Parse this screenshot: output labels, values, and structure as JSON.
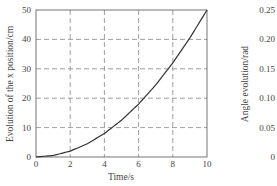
{
  "chart_data": [
    {
      "type": "line",
      "title": "",
      "xlabel": "Time/s",
      "ylabel": "Evolution of the x position/cm",
      "xlim": [
        0,
        10
      ],
      "ylim": [
        0,
        50
      ],
      "xticks": [
        "0",
        "2",
        "4",
        "6",
        "8",
        "10"
      ],
      "yticks": [
        "0",
        "10",
        "20",
        "30",
        "40",
        "50"
      ],
      "grid": "dashed",
      "legend": null,
      "series": [
        {
          "name": "x position",
          "x": [
            0,
            1,
            2,
            3,
            4,
            5,
            6,
            7,
            8,
            9,
            10
          ],
          "y": [
            0,
            0.5,
            2,
            4.5,
            8,
            12.5,
            18,
            24.5,
            32,
            40.5,
            50
          ]
        }
      ]
    },
    {
      "type": "line",
      "title": "",
      "xlabel": "",
      "ylabel": "Angle evolution/rad",
      "ylim": [
        0,
        0.25
      ],
      "yticks": [
        "0",
        "0.05",
        "0.10",
        "0.15",
        "0.20",
        "0.25"
      ],
      "partial": true,
      "series": []
    }
  ],
  "left_chart": {
    "xlabel": "Time/s",
    "ylabel": "Evolution of the x position/cm",
    "xticks": [
      "0",
      "2",
      "4",
      "6",
      "8",
      "10"
    ],
    "yticks": [
      "0",
      "10",
      "20",
      "30",
      "40",
      "50"
    ]
  },
  "right_chart": {
    "ylabel": "Angle evolution/rad",
    "yticks": [
      "0",
      "0.05",
      "0.10",
      "0.15",
      "0.20",
      "0.25"
    ]
  }
}
